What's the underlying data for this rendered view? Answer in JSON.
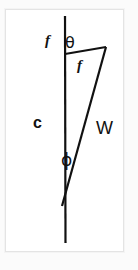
{
  "figure": {
    "background_color": "#fbfbfb",
    "panel_color": "#ffffff",
    "frame_color": "#e4e4e4",
    "stroke_color": "#111111",
    "labels": {
      "force_top": "f",
      "angle_theta": "θ",
      "force_inner": "f",
      "chord": "c",
      "weight": "W",
      "angle_phi": "ϕ"
    },
    "geometry": {
      "vertical_line": {
        "x": 65,
        "y_top": 16,
        "y_bottom": 243
      },
      "triangle": {
        "vertex_top_left": [
          65,
          54
        ],
        "vertex_top_right": [
          106,
          47
        ],
        "vertex_bottom": [
          62,
          206
        ]
      },
      "stroke_width": 2.2
    }
  }
}
